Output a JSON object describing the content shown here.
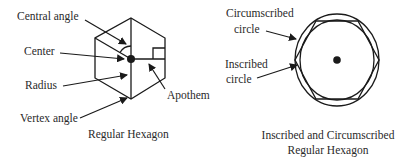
{
  "figure_left": {
    "labels": {
      "central_angle": "Central angle",
      "center": "Center",
      "radius": "Radius",
      "vertex_angle": "Vertex angle",
      "apothem": "Apothem"
    },
    "caption": "Regular Hexagon"
  },
  "figure_right": {
    "labels": {
      "circumscribed_line1": "Circumscribed",
      "circumscribed_line2": "circle",
      "inscribed_line1": "Inscribed",
      "inscribed_line2": "circle"
    },
    "caption_line1": "Inscribed and Circumscribed",
    "caption_line2": "Regular Hexagon"
  },
  "colors": {
    "line": "#1a1a1a",
    "text": "#2a2a2a",
    "background": "#ffffff"
  }
}
